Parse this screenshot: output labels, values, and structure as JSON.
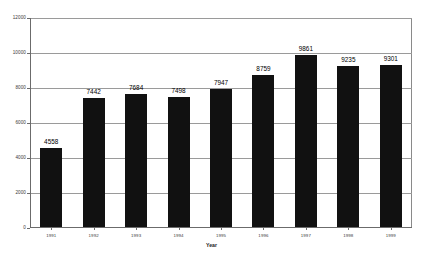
{
  "chart_data": {
    "type": "bar",
    "title": "",
    "subtitle": "",
    "xlabel": "Year",
    "ylabel": "",
    "categories": [
      "1991",
      "1992",
      "1993",
      "1994",
      "1995",
      "1996",
      "1997",
      "1998",
      "1999"
    ],
    "values": [
      4558,
      7442,
      7684,
      7498,
      7947,
      8759,
      9861,
      9235,
      9301
    ],
    "data_labels": [
      "4558",
      "7442",
      "7684",
      "7498",
      "7947",
      "8759",
      "9861",
      "9235",
      "9301"
    ],
    "ylim": [
      0,
      12000
    ],
    "yticks": [
      0,
      2000,
      4000,
      6000,
      8000,
      10000,
      12000
    ],
    "ytick_labels": [
      "0",
      "2000",
      "4000",
      "6000",
      "8000",
      "10000",
      "12000"
    ],
    "grid": true,
    "grid_axis": "y",
    "legend": false,
    "legend_position": "none",
    "bar_color": "#111111",
    "gridline_color": "#9a9a9a",
    "axis_color": "#6b6b6b",
    "frame_color": "#8a8a8a",
    "background_color": "#ffffff",
    "series": [
      {
        "name": "",
        "values": [
          4558,
          7442,
          7684,
          7498,
          7947,
          8759,
          9861,
          9235,
          9301
        ]
      }
    ]
  },
  "axis": {
    "x_title": "Year"
  }
}
